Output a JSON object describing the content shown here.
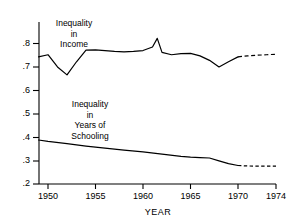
{
  "chart_data": {
    "type": "line",
    "title": "",
    "xlabel": "YEAR",
    "ylabel": "",
    "xlim": [
      1949,
      1974
    ],
    "ylim": [
      0.2,
      0.84
    ],
    "grid": false,
    "legend_position": "inline-annotation",
    "xticks": [
      "1950",
      "1955",
      "1960",
      "1965",
      "1970",
      "1974"
    ],
    "xtick_values": [
      1950,
      1955,
      1960,
      1965,
      1970,
      1974
    ],
    "yticks": [
      ".2",
      ".3",
      ".4",
      ".5",
      ".6",
      ".7",
      ".8"
    ],
    "ytick_values": [
      0.2,
      0.3,
      0.4,
      0.5,
      0.6,
      0.7,
      0.8
    ],
    "annotations": [
      {
        "name": "income-series-label",
        "text_lines": [
          "Inequality",
          "in",
          "Income"
        ]
      },
      {
        "name": "schooling-series-label",
        "text_lines": [
          "Inequality",
          "in",
          "Years of",
          "Schooling"
        ]
      }
    ],
    "series": [
      {
        "name": "Inequality in Income",
        "style": "solid",
        "x": [
          1949,
          1950,
          1951,
          1952,
          1953,
          1954,
          1955,
          1956,
          1957,
          1958,
          1959,
          1960,
          1961,
          1961.5,
          1962,
          1963,
          1964,
          1965,
          1966,
          1967,
          1968,
          1969,
          1970
        ],
        "values": [
          0.743,
          0.752,
          0.7,
          0.666,
          0.722,
          0.772,
          0.773,
          0.77,
          0.766,
          0.764,
          0.766,
          0.77,
          0.785,
          0.822,
          0.762,
          0.752,
          0.757,
          0.758,
          0.747,
          0.728,
          0.7,
          0.722,
          0.743
        ]
      },
      {
        "name": "Inequality in Income (projected)",
        "style": "dashed",
        "x": [
          1970,
          1971,
          1972,
          1973,
          1974
        ],
        "values": [
          0.743,
          0.747,
          0.75,
          0.752,
          0.754
        ]
      },
      {
        "name": "Inequality in Years of Schooling",
        "style": "solid",
        "x": [
          1949,
          1950,
          1952,
          1954,
          1956,
          1958,
          1960,
          1962,
          1964,
          1965,
          1966,
          1967,
          1968,
          1969,
          1970
        ],
        "values": [
          0.388,
          0.382,
          0.372,
          0.362,
          0.353,
          0.345,
          0.337,
          0.328,
          0.318,
          0.315,
          0.313,
          0.311,
          0.299,
          0.287,
          0.279
        ]
      },
      {
        "name": "Inequality in Years of Schooling (projected)",
        "style": "dashed",
        "x": [
          1970,
          1971,
          1972,
          1973,
          1974
        ],
        "values": [
          0.279,
          0.277,
          0.276,
          0.276,
          0.276
        ]
      }
    ]
  },
  "axis": {
    "x_title": "YEAR",
    "y_labels": [
      ".8",
      ".7",
      ".6",
      ".5",
      ".4",
      ".3",
      ".2"
    ],
    "x_labels": [
      "1950",
      "1955",
      "1960",
      "1965",
      "1970",
      "1974"
    ]
  },
  "labels": {
    "income": {
      "line1": "Inequality",
      "line2": "in",
      "line3": "Income"
    },
    "schooling": {
      "line1": "Inequality",
      "line2": "in",
      "line3": "Years of",
      "line4": "Schooling"
    }
  },
  "colors": {
    "line": "#000000",
    "axis": "#000000",
    "background": "#ffffff"
  }
}
